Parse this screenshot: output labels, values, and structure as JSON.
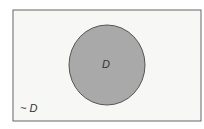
{
  "diagram": {
    "type": "venn",
    "universe_label": "~ D",
    "set_label": "D",
    "colors": {
      "universe_fill": "#f7f7f5",
      "set_fill": "#a9a9a9",
      "stroke": "#555555"
    }
  }
}
